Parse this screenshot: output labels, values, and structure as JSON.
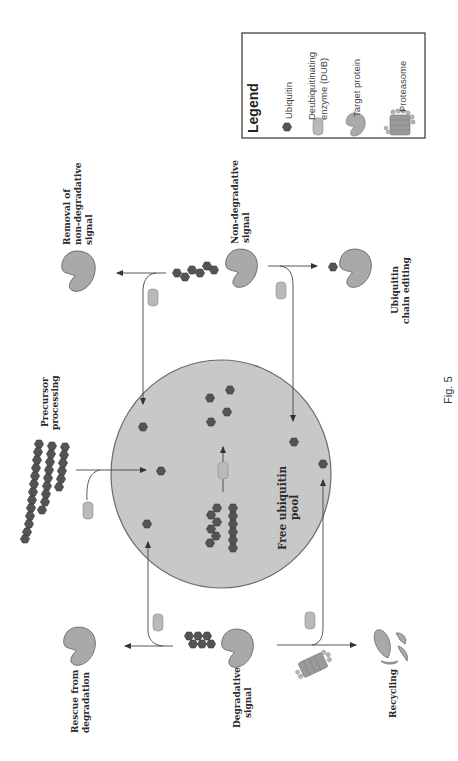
{
  "figure": {
    "caption": "Fig. 5",
    "orientation": "rotated 90° counterclockwise",
    "colors": {
      "background": "#ffffff",
      "pool_fill": "#c9c9c9",
      "pool_stroke": "#6a6a6a",
      "ubiquitin": "#545454",
      "dub": "#b9b9b9",
      "target_protein": "#a9a9a9",
      "lines": "#444444"
    }
  },
  "legend": {
    "title": "Legend",
    "items": [
      {
        "icon": "ubiquitin-icon",
        "label_lines": [
          "Ubiquitin"
        ]
      },
      {
        "icon": "dub-icon",
        "label_lines": [
          "Deubiquitinating",
          "enzyme (DUB)"
        ]
      },
      {
        "icon": "target-protein-icon",
        "label_lines": [
          "Target protein"
        ]
      },
      {
        "icon": "proteasome-icon",
        "label_lines": [
          "Proteasome"
        ]
      }
    ]
  },
  "center": {
    "label_lines": [
      "Free ubiquitin",
      "pool"
    ]
  },
  "nodes": {
    "precursor": {
      "label_lines": [
        "Precursor",
        "processing"
      ]
    },
    "removal": {
      "label_lines": [
        "Removal of",
        "non-degradative",
        "signal"
      ]
    },
    "non_degradative": {
      "label_lines": [
        "Non-degradative",
        "signal"
      ]
    },
    "chain_editing": {
      "label_lines": [
        "Ubiquitin",
        "chain editing"
      ]
    },
    "rescue": {
      "label_lines": [
        "Rescue from",
        "degradation"
      ]
    },
    "degradative": {
      "label_lines": [
        "Degradative",
        "signal"
      ]
    },
    "recycling": {
      "label_lines": [
        "Recycling"
      ]
    }
  }
}
